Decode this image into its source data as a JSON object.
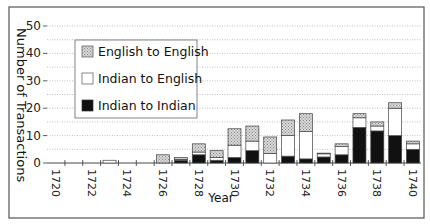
{
  "chart_data": {
    "type": "bar",
    "stacked": true,
    "title": "",
    "xlabel": "Year",
    "ylabel": "Number of Transactions",
    "ylim": [
      0,
      50
    ],
    "yticks": [
      0,
      10,
      20,
      30,
      40,
      50
    ],
    "grid": {
      "y": true,
      "minor_step": 5,
      "style": "dotted"
    },
    "legend_position": "upper-left (inside)",
    "categories": [
      1720,
      1721,
      1722,
      1723,
      1724,
      1725,
      1726,
      1727,
      1728,
      1729,
      1730,
      1731,
      1732,
      1733,
      1734,
      1735,
      1736,
      1737,
      1738,
      1739,
      1740
    ],
    "xtick_labels": [
      "1720",
      "1722",
      "1724",
      "1726",
      "1728",
      "1730",
      "1732",
      "1734",
      "1736",
      "1738",
      "1740"
    ],
    "series": [
      {
        "name": "Indian to Indian",
        "fill": "#111111",
        "values": [
          0,
          0,
          0,
          0,
          0,
          0,
          0,
          1,
          3,
          1,
          2,
          4.5,
          0,
          2.5,
          1.5,
          2.2,
          3,
          13,
          11.7,
          10,
          5
        ]
      },
      {
        "name": "Indian to English",
        "fill": "#ffffff",
        "values": [
          0,
          0,
          0,
          1,
          0,
          0,
          0,
          0.3,
          1,
          1,
          4.5,
          3.5,
          3.5,
          7.5,
          10,
          1.2,
          3,
          3.5,
          1.8,
          10,
          2
        ]
      },
      {
        "name": "English to English",
        "fill": "hatched-gray",
        "values": [
          0,
          0,
          0,
          0,
          0,
          0,
          3,
          0.7,
          3,
          2.5,
          6,
          5.5,
          6,
          5.7,
          6.5,
          0.2,
          1,
          1.5,
          1.5,
          2,
          1
        ]
      }
    ]
  },
  "legend": {
    "items": [
      {
        "label": "English to English",
        "swatch": "hatched-gray"
      },
      {
        "label": "Indian to English",
        "swatch": "white"
      },
      {
        "label": "Indian to Indian",
        "swatch": "black"
      }
    ]
  },
  "axes": {
    "y_title": "Number of Transactions",
    "x_title": "Year"
  }
}
